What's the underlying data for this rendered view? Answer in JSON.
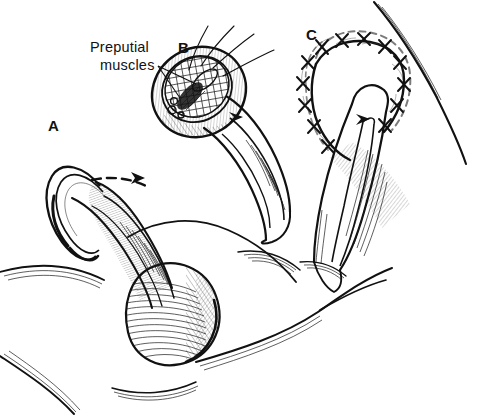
{
  "figure": {
    "style": "pen-and-ink line drawing",
    "background_color": "#ffffff",
    "ink_color": "#111111",
    "width": 477,
    "height": 417
  },
  "annotations": {
    "preputial_muscles": {
      "line1": "Preputial",
      "line2": "muscles",
      "full_text": "Preputial muscles",
      "x": 90,
      "y": 52
    }
  },
  "panels": [
    {
      "id": "A",
      "letter": "A",
      "x": 48,
      "y": 131,
      "description": "Intact prepuce with dashed incision line and directional arrow"
    },
    {
      "id": "B",
      "letter": "B",
      "x": 178,
      "y": 53,
      "description": "Dissected prepuce exposing cross-hatched preputial muscles with stay sutures"
    },
    {
      "id": "C",
      "letter": "C",
      "x": 306,
      "y": 40,
      "description": "Closed incision with interrupted cross-stitch sutures along the arc"
    }
  ],
  "markers": {
    "arrowheads": [
      {
        "panel": "A",
        "x": 137,
        "y": 177
      },
      {
        "panel": "B",
        "x": 235,
        "y": 118
      },
      {
        "panel": "C",
        "x": 362,
        "y": 120
      }
    ],
    "suture_threads_count": 4,
    "stitch_count": 13,
    "vessel_dots_count": 3
  }
}
